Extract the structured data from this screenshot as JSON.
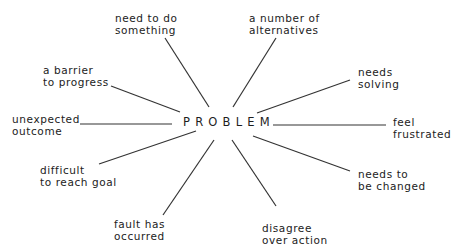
{
  "diagram": {
    "type": "spider-diagram",
    "center": {
      "label": "PROBLEM"
    },
    "line_color": "#333333",
    "spokes": [
      {
        "id": "need-to-do-something",
        "lines": [
          "need to do",
          "something"
        ],
        "x": 115,
        "y": 12,
        "from": [
          165,
          38
        ],
        "to": [
          209,
          107
        ]
      },
      {
        "id": "a-number-of-alternatives",
        "lines": [
          "a number of",
          "alternatives"
        ],
        "x": 249,
        "y": 12,
        "from": [
          276,
          38
        ],
        "to": [
          233,
          107
        ]
      },
      {
        "id": "a-barrier-to-progress",
        "lines": [
          "a barrier",
          "to progress"
        ],
        "x": 43,
        "y": 64,
        "from": [
          111,
          86
        ],
        "to": [
          180,
          112
        ]
      },
      {
        "id": "needs-solving",
        "lines": [
          "needs",
          "solving"
        ],
        "x": 358,
        "y": 66,
        "from": [
          350,
          80
        ],
        "to": [
          257,
          113
        ]
      },
      {
        "id": "unexpected-outcome",
        "lines": [
          "unexpected",
          "outcome"
        ],
        "x": 12,
        "y": 113,
        "from": [
          80,
          124
        ],
        "to": [
          172,
          124
        ]
      },
      {
        "id": "feel-frustrated",
        "lines": [
          "feel",
          "frustrated"
        ],
        "x": 393,
        "y": 116,
        "from": [
          273,
          125
        ],
        "to": [
          386,
          125
        ]
      },
      {
        "id": "difficult-to-reach-goal",
        "lines": [
          "difficult",
          "to reach goal"
        ],
        "x": 40,
        "y": 164,
        "from": [
          99,
          164
        ],
        "to": [
          196,
          131
        ]
      },
      {
        "id": "needs-to-be-changed",
        "lines": [
          "needs to",
          "be changed"
        ],
        "x": 358,
        "y": 168,
        "from": [
          350,
          171
        ],
        "to": [
          253,
          136
        ]
      },
      {
        "id": "fault-has-occurred",
        "lines": [
          "fault has",
          "occurred"
        ],
        "x": 114,
        "y": 218,
        "from": [
          163,
          215
        ],
        "to": [
          214,
          140
        ]
      },
      {
        "id": "disagree-over-action",
        "lines": [
          "disagree",
          "over action"
        ],
        "x": 262,
        "y": 222,
        "from": [
          276,
          206
        ],
        "to": [
          232,
          140
        ]
      }
    ]
  }
}
